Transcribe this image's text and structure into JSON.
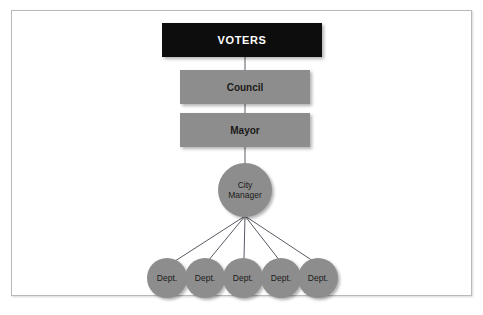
{
  "diagram": {
    "type": "organizational-chart",
    "frame": {
      "border_color": "#b9b9b9",
      "background": "#ffffff"
    },
    "colors": {
      "dark_box": "#0d0d0d",
      "dark_box_text": "#ffffff",
      "gray_fill": "#8d8d8d",
      "gray_text": "#1a1a1a",
      "connector_line": "#4a4a5a"
    },
    "nodes": {
      "voters": {
        "label": "VOTERS",
        "shape": "rectangle",
        "fill": "#0d0d0d",
        "text_color": "#ffffff"
      },
      "council": {
        "label": "Council",
        "shape": "rectangle",
        "fill": "#8d8d8d",
        "text_color": "#1a1a1a"
      },
      "mayor": {
        "label": "Mayor",
        "shape": "rectangle",
        "fill": "#8d8d8d",
        "text_color": "#1a1a1a"
      },
      "city_manager": {
        "label": "City\nManager",
        "shape": "circle",
        "fill": "#8d8d8d",
        "text_color": "#1a1a1a"
      }
    },
    "departments": [
      {
        "label": "Dept."
      },
      {
        "label": "Dept."
      },
      {
        "label": "Dept."
      },
      {
        "label": "Dept."
      },
      {
        "label": "Dept."
      }
    ]
  }
}
